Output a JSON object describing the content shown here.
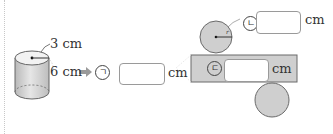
{
  "cylinder": {
    "radius_label": "3 cm",
    "height_label": "6 cm"
  },
  "answer_a": {
    "marker": "ㄱ",
    "unit": "cm",
    "value": ""
  },
  "answer_b": {
    "marker": "ㄴ",
    "unit": "cm",
    "value": ""
  },
  "answer_c": {
    "marker": "ㄷ",
    "unit": "cm",
    "value": ""
  },
  "net": {
    "radius_marker": "r"
  },
  "colors": {
    "shape_fill": "#cfcfcf",
    "shape_stroke": "#6a6a6a",
    "arrow": "#9a9a9a"
  }
}
